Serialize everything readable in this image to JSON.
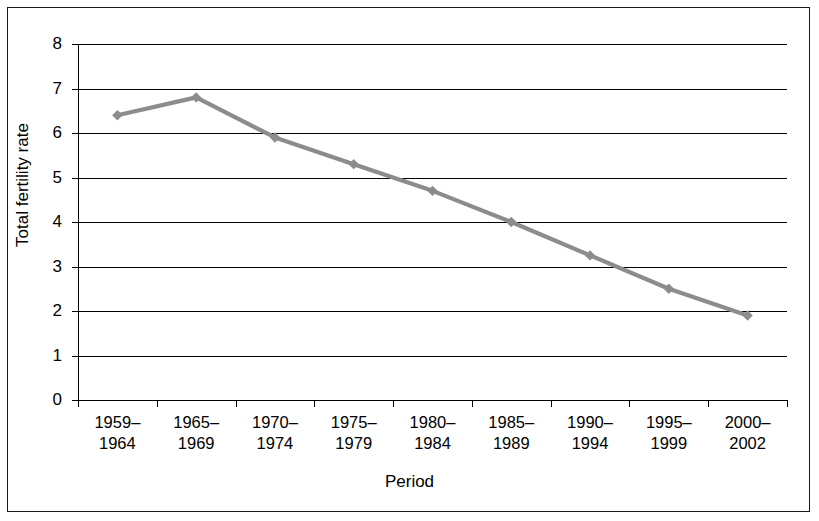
{
  "chart_data": {
    "type": "line",
    "title": "",
    "xlabel": "Period",
    "ylabel": "Total fertility rate",
    "categories": [
      "1959–\n1964",
      "1965–\n1969",
      "1970–\n1974",
      "1975–\n1979",
      "1980–\n1984",
      "1985–\n1989",
      "1990–\n1994",
      "1995–\n1999",
      "2000–\n2002"
    ],
    "category_lines": [
      [
        "1959–",
        "1964"
      ],
      [
        "1965–",
        "1969"
      ],
      [
        "1970–",
        "1974"
      ],
      [
        "1975–",
        "1979"
      ],
      [
        "1980–",
        "1984"
      ],
      [
        "1985–",
        "1989"
      ],
      [
        "1990–",
        "1994"
      ],
      [
        "1995–",
        "1999"
      ],
      [
        "2000–",
        "2002"
      ]
    ],
    "values": [
      6.4,
      6.8,
      5.9,
      5.3,
      4.7,
      4.0,
      3.25,
      2.5,
      1.9
    ],
    "series": [
      {
        "name": "Total fertility rate",
        "values": [
          6.4,
          6.8,
          5.9,
          5.3,
          4.7,
          4.0,
          3.25,
          2.5,
          1.9
        ]
      }
    ],
    "ylim": [
      0,
      8
    ],
    "yticks": [
      0,
      1,
      2,
      3,
      4,
      5,
      6,
      7,
      8
    ],
    "ytick_labels": [
      "0",
      "1",
      "2",
      "3",
      "4",
      "5",
      "6",
      "7",
      "8"
    ],
    "grid": true,
    "grid_axis": "y",
    "legend": "none",
    "marker": "diamond",
    "line_color": "#8c8c8c",
    "marker_color": "#8c8c8c",
    "grid_color": "#000000",
    "axis_color": "#000000",
    "frame_color": "#1a1a1a",
    "background": "#ffffff"
  },
  "axis": {
    "y_title": "Total fertility rate",
    "x_title": "Period"
  }
}
